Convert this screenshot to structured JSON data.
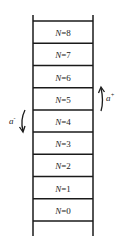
{
  "diagram": {
    "type": "ladder",
    "levels": [
      "N=0",
      "N=1",
      "N=2",
      "N=3",
      "N=4",
      "N=5",
      "N=6",
      "N=7",
      "N=8"
    ],
    "lowering_operator": {
      "label": "a",
      "superscript": "-",
      "direction": "down"
    },
    "raising_operator": {
      "label": "a",
      "superscript": "+",
      "direction": "up"
    },
    "line_color": "#1a1a1a"
  }
}
